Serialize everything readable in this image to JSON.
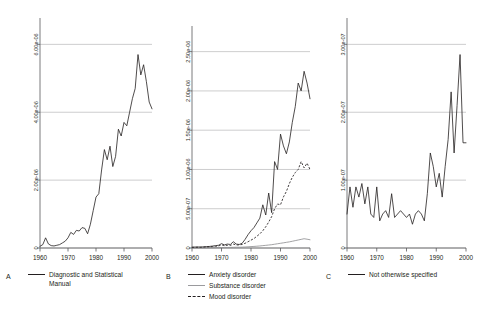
{
  "figure": {
    "panels": [
      {
        "letter": "A",
        "name": "panel-a",
        "y_ticks": [
          "6.00e-06",
          "4.00e-06",
          "2.00e-06",
          "0"
        ],
        "y_tick_values": [
          6e-06,
          4e-06,
          2e-06,
          0
        ],
        "x_ticks": [
          "1960",
          "1970",
          "1980",
          "1990",
          "2000"
        ],
        "legend": [
          {
            "label": "Diagnostic and Statistical\nManual",
            "style": "solid"
          }
        ]
      },
      {
        "letter": "B",
        "name": "panel-b",
        "y_ticks": [
          "2.50e-06",
          "2.00e-06",
          "1.50e-06",
          "1.00e-06",
          "5.00e-07",
          "0"
        ],
        "y_tick_values": [
          2.5e-06,
          2e-06,
          1.5e-06,
          1e-06,
          5e-07,
          0
        ],
        "x_ticks": [
          "1960",
          "1970",
          "1980",
          "1990",
          "2000"
        ],
        "legend": [
          {
            "label": "Anxiety disorder",
            "style": "solid"
          },
          {
            "label": "Substance disorder",
            "style": "light"
          },
          {
            "label": "Mood disorder",
            "style": "dashed"
          }
        ]
      },
      {
        "letter": "C",
        "name": "panel-c",
        "y_ticks": [
          "3.00e-07",
          "2.00e-07",
          "1.00e-07",
          "0"
        ],
        "y_tick_values": [
          3e-07,
          2e-07,
          1e-07,
          0
        ],
        "x_ticks": [
          "1960",
          "1970",
          "1980",
          "1990",
          "2000"
        ],
        "legend": [
          {
            "label": "Not otherwise specified",
            "style": "solid"
          }
        ]
      }
    ]
  },
  "chart_data": [
    {
      "type": "line",
      "panel": "A",
      "title": "",
      "xlabel": "",
      "ylabel": "",
      "xlim": [
        1960,
        2000
      ],
      "ylim": [
        0,
        6.6e-06
      ],
      "grid": true,
      "gridlines_y": [
        2e-06,
        4e-06,
        6e-06
      ],
      "legend_position": "below",
      "series": [
        {
          "name": "Diagnostic and Statistical Manual",
          "style": "solid",
          "x": [
            1960,
            1961,
            1962,
            1963,
            1964,
            1965,
            1966,
            1967,
            1968,
            1969,
            1970,
            1971,
            1972,
            1973,
            1974,
            1975,
            1976,
            1977,
            1978,
            1979,
            1980,
            1981,
            1982,
            1983,
            1984,
            1985,
            1986,
            1987,
            1988,
            1989,
            1990,
            1991,
            1992,
            1993,
            1994,
            1995,
            1996,
            1997,
            1998,
            1999,
            2000
          ],
          "y": [
            5e-08,
            1e-07,
            3e-07,
            1.2e-07,
            7e-08,
            6e-08,
            8e-08,
            1e-07,
            1.5e-07,
            2e-07,
            3e-07,
            4.6e-07,
            4e-07,
            5.2e-07,
            5e-07,
            6e-07,
            5.8e-07,
            4.2e-07,
            7e-07,
            1.1e-06,
            1.5e-06,
            1.6e-06,
            2.3e-06,
            2.9e-06,
            2.6e-06,
            3e-06,
            2.4e-06,
            2.7e-06,
            3.5e-06,
            3.3e-06,
            3.7e-06,
            3.6e-06,
            4e-06,
            4.4e-06,
            4.7e-06,
            5.7e-06,
            5.1e-06,
            5.4e-06,
            4.9e-06,
            4.3e-06,
            4.1e-06
          ]
        }
      ]
    },
    {
      "type": "line",
      "panel": "B",
      "title": "",
      "xlabel": "",
      "ylabel": "",
      "xlim": [
        1960,
        2000
      ],
      "ylim": [
        0,
        2.75e-06
      ],
      "grid": true,
      "gridlines_y": [
        5e-07,
        1e-06,
        1.5e-06,
        2e-06,
        2.5e-06
      ],
      "legend_position": "below",
      "series": [
        {
          "name": "Anxiety disorder",
          "style": "solid",
          "x": [
            1960,
            1961,
            1962,
            1963,
            1964,
            1965,
            1966,
            1967,
            1968,
            1969,
            1970,
            1971,
            1972,
            1973,
            1974,
            1975,
            1976,
            1977,
            1978,
            1979,
            1980,
            1981,
            1982,
            1983,
            1984,
            1985,
            1986,
            1987,
            1988,
            1989,
            1990,
            1991,
            1992,
            1993,
            1994,
            1995,
            1996,
            1997,
            1998,
            1999,
            2000
          ],
          "y": [
            1e-08,
            1.2e-08,
            1.3e-08,
            1.2e-08,
            1.5e-08,
            1.8e-08,
            2e-08,
            2.5e-08,
            3e-08,
            3.5e-08,
            5.5e-08,
            4e-08,
            5e-08,
            4.5e-08,
            8e-08,
            5e-08,
            4.5e-08,
            6e-08,
            1.1e-07,
            1.7e-07,
            2.2e-07,
            2.6e-07,
            3.2e-07,
            3.8e-07,
            5.5e-07,
            4.2e-07,
            7e-07,
            4.5e-07,
            1.1e-06,
            1e-06,
            1.45e-06,
            1.3e-06,
            1.2e-06,
            1.35e-06,
            1.6e-06,
            1.8e-06,
            2.1e-06,
            2e-06,
            2.25e-06,
            2.1e-06,
            1.9e-06
          ]
        },
        {
          "name": "Substance disorder",
          "style": "light",
          "x": [
            1960,
            1961,
            1962,
            1963,
            1964,
            1965,
            1966,
            1967,
            1968,
            1969,
            1970,
            1971,
            1972,
            1973,
            1974,
            1975,
            1976,
            1977,
            1978,
            1979,
            1980,
            1981,
            1982,
            1983,
            1984,
            1985,
            1986,
            1987,
            1988,
            1989,
            1990,
            1991,
            1992,
            1993,
            1994,
            1995,
            1996,
            1997,
            1998,
            1999,
            2000
          ],
          "y": [
            2e-09,
            2e-09,
            2e-09,
            3e-09,
            3e-09,
            3e-09,
            4e-09,
            4e-09,
            5e-09,
            5e-09,
            6e-09,
            7e-09,
            7e-09,
            8e-09,
            9e-09,
            1e-08,
            1e-08,
            1.1e-08,
            1.3e-08,
            1.5e-08,
            1.8e-08,
            2e-08,
            2.3e-08,
            2.6e-08,
            3e-08,
            3.4e-08,
            3.8e-08,
            4.2e-08,
            4.8e-08,
            5.4e-08,
            6e-08,
            6.6e-08,
            7.2e-08,
            7.8e-08,
            8.6e-08,
            9.4e-08,
            1.02e-07,
            1.1e-07,
            1.18e-07,
            1.12e-07,
            1.05e-07
          ]
        },
        {
          "name": "Mood disorder",
          "style": "dashed",
          "x": [
            1960,
            1961,
            1962,
            1963,
            1964,
            1965,
            1966,
            1967,
            1968,
            1969,
            1970,
            1971,
            1972,
            1973,
            1974,
            1975,
            1976,
            1977,
            1978,
            1979,
            1980,
            1981,
            1982,
            1983,
            1984,
            1985,
            1986,
            1987,
            1988,
            1989,
            1990,
            1991,
            1992,
            1993,
            1994,
            1995,
            1996,
            1997,
            1998,
            1999,
            2000
          ],
          "y": [
            8e-09,
            9e-09,
            1e-08,
            1e-08,
            1.2e-08,
            1.4e-08,
            1.6e-08,
            1.8e-08,
            2.2e-08,
            2.6e-08,
            4e-08,
            3e-08,
            3.5e-08,
            3.2e-08,
            5e-08,
            3.8e-08,
            4e-08,
            4.5e-08,
            6e-08,
            8e-08,
            1e-07,
            1.2e-07,
            1.5e-07,
            1.8e-07,
            2.2e-07,
            2.7e-07,
            3.3e-07,
            4e-07,
            5e-07,
            5.6e-07,
            5.5e-07,
            6.5e-07,
            7.2e-07,
            8.2e-07,
            9e-07,
            9.6e-07,
            1e-06,
            1.1e-06,
            1.02e-06,
            1.08e-06,
            1e-06
          ]
        }
      ]
    },
    {
      "type": "line",
      "panel": "C",
      "title": "",
      "xlabel": "",
      "ylabel": "",
      "xlim": [
        1960,
        2000
      ],
      "ylim": [
        0,
        3.3e-07
      ],
      "grid": true,
      "gridlines_y": [
        1e-07,
        2e-07,
        3e-07
      ],
      "legend_position": "below",
      "series": [
        {
          "name": "Not otherwise specified",
          "style": "solid",
          "x": [
            1960,
            1961,
            1962,
            1963,
            1964,
            1965,
            1966,
            1967,
            1968,
            1969,
            1970,
            1971,
            1972,
            1973,
            1974,
            1975,
            1976,
            1977,
            1978,
            1979,
            1980,
            1981,
            1982,
            1983,
            1984,
            1985,
            1986,
            1987,
            1988,
            1989,
            1990,
            1991,
            1992,
            1993,
            1994,
            1995,
            1996,
            1997,
            1998,
            1999,
            2000
          ],
          "y": [
            5e-08,
            9e-08,
            6e-08,
            9e-08,
            7.5e-08,
            9.5e-08,
            6.5e-08,
            9e-08,
            5e-08,
            4.5e-08,
            9e-08,
            4e-08,
            5e-08,
            5.5e-08,
            4.5e-08,
            8e-08,
            4.5e-08,
            5e-08,
            5.5e-08,
            5e-08,
            4.5e-08,
            5e-08,
            3.5e-08,
            5e-08,
            5.5e-08,
            5e-08,
            4e-08,
            8e-08,
            1.4e-07,
            1.2e-07,
            9e-08,
            1.1e-07,
            7.5e-08,
            1.2e-07,
            1.6e-07,
            2.3e-07,
            1.4e-07,
            2.1e-07,
            2.85e-07,
            1.55e-07,
            1.55e-07
          ]
        }
      ]
    }
  ]
}
